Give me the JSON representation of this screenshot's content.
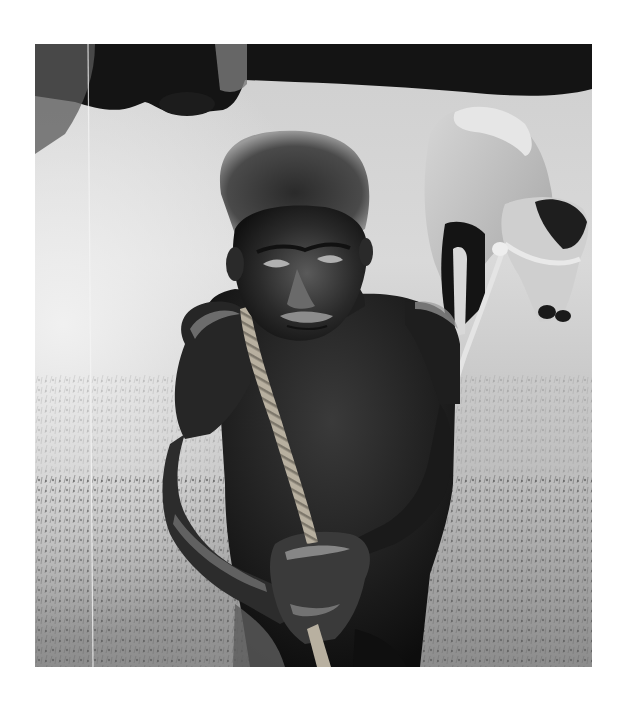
{
  "image": {
    "kind": "black-and-white photograph",
    "alt": "Elderly shirtless man with grey curly hair leaning forward, gripping a thick rope over his shoulder, pulling a horse in a grassy field",
    "has_visible_text": false
  },
  "subjects": [
    {
      "id": "man",
      "description": "Elderly man, shirtless, curly grey hair, holding rope with both hands"
    },
    {
      "id": "rope",
      "description": "Thick twisted rope running from his shoulder down to his clasped hands"
    },
    {
      "id": "horse",
      "description": "Light-coloured horse behind him on the right, head lowered, wearing rope halter"
    },
    {
      "id": "grass",
      "description": "Bright grassy field, darker tree line at the top"
    }
  ],
  "palette": {
    "paper": "#ffffff",
    "sky_dark": "#141414",
    "field_light": "#d9d9d9",
    "field_mid": "#a8a8a8",
    "skin_dark": "#1a1a1a",
    "rope": "#b8b0a0",
    "horse_light": "#c8c8c8"
  }
}
